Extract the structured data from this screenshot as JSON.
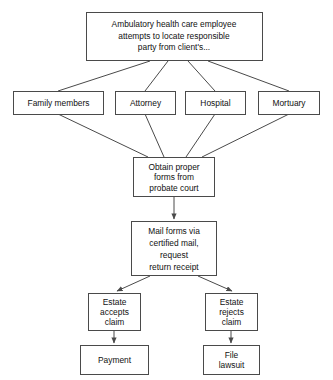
{
  "diagram": {
    "background_color": "#ffffff",
    "line_color": "#4a4a4a",
    "text_color": "#111111",
    "nodes": {
      "start": {
        "lines": [
          "Ambulatory health care employee",
          "attempts to locate responsible",
          "party from client's..."
        ]
      },
      "family_members": {
        "lines": [
          "Family members"
        ]
      },
      "attorney": {
        "lines": [
          "Attorney"
        ]
      },
      "hospital": {
        "lines": [
          "Hospital"
        ]
      },
      "mortuary": {
        "lines": [
          "Mortuary"
        ]
      },
      "obtain_forms": {
        "lines": [
          "Obtain proper",
          "forms from",
          "probate court"
        ]
      },
      "mail_forms": {
        "lines": [
          "Mail forms via",
          "certified mail,",
          "request",
          "return receipt"
        ]
      },
      "estate_accepts": {
        "lines": [
          "Estate",
          "accepts",
          "claim"
        ]
      },
      "estate_rejects": {
        "lines": [
          "Estate",
          "rejects",
          "claim"
        ]
      },
      "payment": {
        "lines": [
          "Payment"
        ]
      },
      "file_lawsuit": {
        "lines": [
          "File",
          "lawsuit"
        ]
      }
    }
  }
}
